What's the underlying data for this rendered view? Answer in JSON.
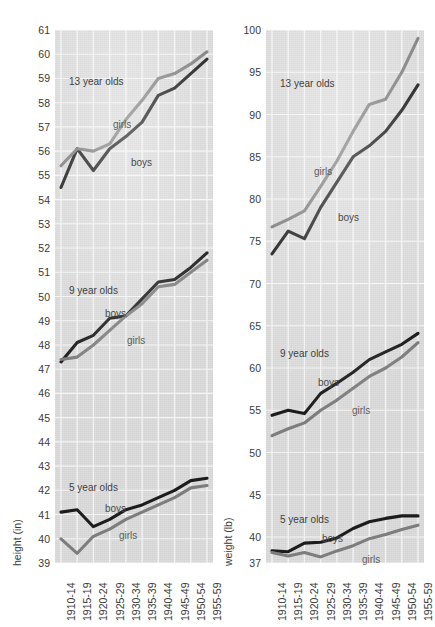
{
  "figure": {
    "background": "#ffffff",
    "plot_background": "#dcdcdc",
    "gridline_color": "#f4f4f4",
    "boys_color": "#1c1c1c",
    "girls_color": "#7d7d7d"
  },
  "periods": [
    "1910-14",
    "1915-19",
    "1920-24",
    "1925-29",
    "1930-34",
    "1935-39",
    "1940-44",
    "1945-49",
    "1950-54",
    "1955-59"
  ],
  "panels": {
    "height": {
      "axis_title": "height (in)",
      "yticks": [
        39,
        40,
        41,
        42,
        43,
        44,
        45,
        46,
        47,
        48,
        49,
        50,
        51,
        52,
        53,
        54,
        55,
        56,
        57,
        58,
        59,
        60,
        61
      ],
      "ylim": [
        39,
        61
      ],
      "groups": [
        {
          "label": "13 year olds",
          "boys_label": "boys",
          "girls_label": "girls"
        },
        {
          "label": "9 year olds",
          "boys_label": "boys",
          "girls_label": "girls"
        },
        {
          "label": "5 year olds",
          "boys_label": "boys",
          "girls_label": "girls"
        }
      ]
    },
    "weight": {
      "axis_title": "weight (lb)",
      "yticks": [
        37,
        40,
        45,
        50,
        55,
        60,
        65,
        70,
        75,
        80,
        85,
        90,
        95,
        100
      ],
      "ylim": [
        37,
        100
      ],
      "groups": [
        {
          "label": "13 year olds",
          "boys_label": "boys",
          "girls_label": "girls"
        },
        {
          "label": "9 year olds",
          "boys_label": "boys",
          "girls_label": "girls"
        },
        {
          "label": "5 year olds",
          "boys_label": "boys",
          "girls_label": "girls"
        }
      ]
    }
  },
  "chart_data": [
    {
      "type": "line",
      "title": "",
      "xlabel": "",
      "ylabel": "height (in)",
      "ylim": [
        39,
        61
      ],
      "grid": true,
      "legend": "inline-labels",
      "categories": [
        "1910-14",
        "1915-19",
        "1920-24",
        "1925-29",
        "1930-34",
        "1935-39",
        "1940-44",
        "1945-49",
        "1950-54",
        "1955-59"
      ],
      "series": [
        {
          "name": "13 year olds boys",
          "values": [
            54.5,
            56.1,
            55.2,
            56.1,
            56.6,
            57.2,
            58.3,
            58.6,
            59.2,
            59.8
          ]
        },
        {
          "name": "13 year olds girls",
          "values": [
            55.4,
            56.1,
            56.0,
            56.3,
            57.3,
            58.1,
            59.0,
            59.2,
            59.6,
            60.1
          ]
        },
        {
          "name": "9 year olds boys",
          "values": [
            47.3,
            48.1,
            48.4,
            49.1,
            49.2,
            49.9,
            50.6,
            50.7,
            51.2,
            51.8
          ]
        },
        {
          "name": "9 year olds girls",
          "values": [
            47.4,
            47.5,
            48.0,
            48.6,
            49.2,
            49.7,
            50.4,
            50.5,
            51.0,
            51.5
          ]
        },
        {
          "name": "5 year olds boys",
          "values": [
            41.1,
            41.2,
            40.5,
            40.8,
            41.2,
            41.4,
            41.7,
            42.0,
            42.4,
            42.5
          ]
        },
        {
          "name": "5 year olds girls",
          "values": [
            40.0,
            39.4,
            40.1,
            40.4,
            40.8,
            41.1,
            41.4,
            41.7,
            42.1,
            42.2
          ]
        }
      ]
    },
    {
      "type": "line",
      "title": "",
      "xlabel": "",
      "ylabel": "weight (lb)",
      "ylim": [
        37,
        100
      ],
      "grid": true,
      "legend": "inline-labels",
      "categories": [
        "1910-14",
        "1915-19",
        "1920-24",
        "1925-29",
        "1930-34",
        "1935-39",
        "1940-44",
        "1945-49",
        "1950-54",
        "1955-59"
      ],
      "series": [
        {
          "name": "13 year olds boys",
          "values": [
            73.5,
            76.2,
            75.3,
            79.0,
            82.0,
            85.0,
            86.3,
            88.0,
            90.5,
            93.5
          ]
        },
        {
          "name": "13 year olds girls",
          "values": [
            76.7,
            77.6,
            78.6,
            81.5,
            84.5,
            88.0,
            91.2,
            91.8,
            95.0,
            99.0
          ]
        },
        {
          "name": "9 year olds boys",
          "values": [
            54.4,
            55.0,
            54.6,
            57.0,
            58.2,
            59.5,
            61.0,
            61.9,
            62.8,
            64.1
          ]
        },
        {
          "name": "9 year olds girls",
          "values": [
            52.0,
            52.8,
            53.5,
            55.0,
            56.2,
            57.6,
            59.0,
            60.0,
            61.3,
            63.0
          ]
        },
        {
          "name": "5 year olds boys",
          "values": [
            38.4,
            38.3,
            39.3,
            39.4,
            39.9,
            41.0,
            41.8,
            42.2,
            42.5,
            42.5
          ]
        },
        {
          "name": "5 year olds girls",
          "values": [
            38.2,
            37.8,
            38.2,
            37.7,
            38.4,
            39.0,
            39.8,
            40.3,
            40.9,
            41.4
          ]
        }
      ]
    }
  ]
}
